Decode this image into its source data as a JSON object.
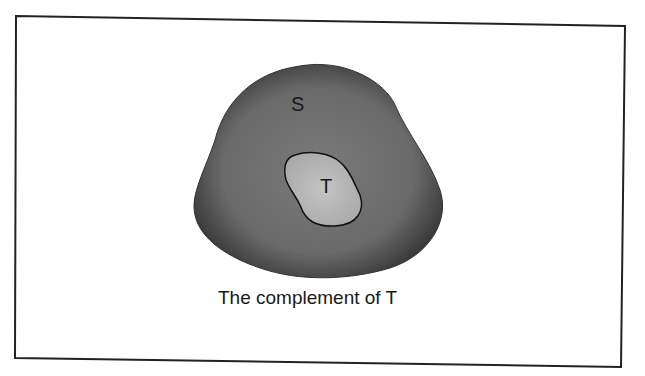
{
  "diagram": {
    "type": "venn-complement",
    "sets": [
      {
        "label": "S",
        "role": "universal set",
        "fill": "#6a6a6a"
      },
      {
        "label": "T",
        "role": "subset",
        "fill": "#b5b5b5"
      }
    ],
    "caption": "The complement of T"
  }
}
